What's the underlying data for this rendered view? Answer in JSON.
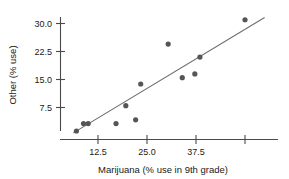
{
  "chart_data": {
    "type": "scatter",
    "title": "",
    "xlabel": "Marijuana (% use in 9th grade)",
    "ylabel": "Other (% use)",
    "xlim": [
      5.5,
      55.5
    ],
    "ylim": [
      0.0,
      32.5
    ],
    "grid": false,
    "legend": null,
    "xticks": [
      12.5,
      25.0,
      37.5,
      50.0
    ],
    "xtick_labels": [
      "12.5",
      "25.0",
      "37.5",
      ""
    ],
    "yticks": [
      7.5,
      15.0,
      22.5,
      30.0
    ],
    "ytick_labels": [
      "7.5",
      "15.0",
      "22.5",
      "30.0"
    ],
    "x": [
      7.0,
      8.8,
      10.0,
      17.1,
      19.6,
      22.1,
      23.4,
      30.4,
      34.0,
      37.2,
      38.5,
      42.8,
      50.0
    ],
    "y": [
      1.2,
      3.2,
      3.2,
      3.2,
      8.0,
      4.2,
      13.8,
      24.5,
      15.5,
      16.5,
      21.0,
      21.0,
      31.0
    ],
    "points": [
      {
        "x": 7.0,
        "y": 1.2
      },
      {
        "x": 8.8,
        "y": 3.2
      },
      {
        "x": 10.0,
        "y": 3.2
      },
      {
        "x": 17.1,
        "y": 3.2
      },
      {
        "x": 19.6,
        "y": 8.0
      },
      {
        "x": 22.1,
        "y": 4.2
      },
      {
        "x": 23.4,
        "y": 13.8
      },
      {
        "x": 30.4,
        "y": 24.5
      },
      {
        "x": 34.0,
        "y": 15.5
      },
      {
        "x": 37.2,
        "y": 16.5
      },
      {
        "x": 38.5,
        "y": 21.0
      },
      {
        "x": 50.0,
        "y": 31.0
      }
    ],
    "marker": {
      "shape": "circle",
      "radius_px": 2.6,
      "color": "#555555"
    },
    "fit_line": {
      "type": "linear-regression",
      "x_start": 6.2,
      "y_start": 0.7,
      "x_end": 55.0,
      "y_end": 31.6,
      "color": "#6b6b6b"
    },
    "colors": {
      "marker": "#555555",
      "line": "#6b6b6b",
      "axis": "#4a4a4a",
      "text": "#1a1a1a",
      "background": "#ffffff"
    }
  }
}
